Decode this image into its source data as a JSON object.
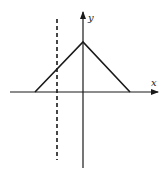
{
  "diagram": {
    "type": "function-plot",
    "axes": {
      "x_label": "x",
      "y_label": "y"
    },
    "colors": {
      "stroke": "#1a1a1a",
      "background": "#ffffff"
    },
    "elements": [
      {
        "name": "x-axis",
        "style": "solid arrow"
      },
      {
        "name": "y-axis",
        "style": "solid arrow"
      },
      {
        "name": "triangle-graph",
        "style": "solid",
        "shape": "peak on y-axis, base on x-axis, right side extends farther than left"
      },
      {
        "name": "vertical-dashed-line",
        "style": "dashed",
        "position": "left of y-axis, crossing left edge of triangle"
      }
    ]
  }
}
